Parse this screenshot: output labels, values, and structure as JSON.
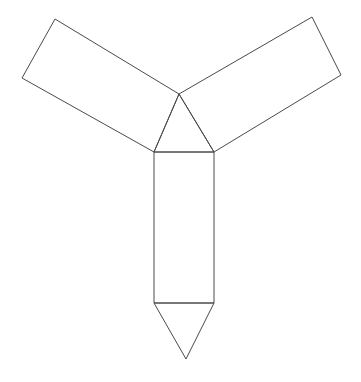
{
  "figure": {
    "name": "triangular-prism-net",
    "canvas": {
      "width": 361,
      "height": 382
    },
    "style": {
      "background_color": "#ffffff",
      "stroke_color": "#4a4a4a",
      "stroke_width": 1,
      "fill_color": "none"
    },
    "vertices": {
      "center_apex": [
        179,
        94
      ],
      "triangle_left": [
        154,
        152
      ],
      "triangle_right": [
        214,
        152
      ],
      "left_arm_outer_top": [
        55,
        19
      ],
      "left_arm_outer_bottom": [
        22,
        78
      ],
      "right_arm_outer_top": [
        312,
        17
      ],
      "right_arm_outer_bottom": [
        341,
        75
      ],
      "rect_bottom_left": [
        154,
        303
      ],
      "rect_bottom_right": [
        214,
        303
      ],
      "bottom_apex": [
        186,
        359
      ]
    },
    "faces": [
      {
        "name": "center-triangle",
        "shape": "triangle",
        "points": "179,94 154,152 214,152"
      },
      {
        "name": "left-rectangle-arm",
        "shape": "parallelogram",
        "points": "179,94 55,19 22,78 154,152"
      },
      {
        "name": "right-rectangle-arm",
        "shape": "parallelogram",
        "points": "179,94 312,17 341,75 214,152"
      },
      {
        "name": "bottom-rectangle-arm",
        "shape": "rectangle",
        "points": "154,152 214,152 214,303 154,303"
      },
      {
        "name": "bottom-triangle",
        "shape": "triangle",
        "points": "154,303 214,303 186,359"
      }
    ],
    "edges": [
      {
        "name": "center-triangle-left-edge",
        "from": "center_apex",
        "to": "triangle_left"
      },
      {
        "name": "center-triangle-right-edge",
        "from": "center_apex",
        "to": "triangle_right"
      },
      {
        "name": "center-triangle-base-edge",
        "from": "triangle_left",
        "to": "triangle_right"
      },
      {
        "name": "left-arm-top-edge",
        "from": "center_apex",
        "to": "left_arm_outer_top"
      },
      {
        "name": "left-arm-outer-edge",
        "from": "left_arm_outer_top",
        "to": "left_arm_outer_bottom"
      },
      {
        "name": "left-arm-bottom-edge",
        "from": "left_arm_outer_bottom",
        "to": "triangle_left"
      },
      {
        "name": "right-arm-top-edge",
        "from": "center_apex",
        "to": "right_arm_outer_top"
      },
      {
        "name": "right-arm-outer-edge",
        "from": "right_arm_outer_top",
        "to": "right_arm_outer_bottom"
      },
      {
        "name": "right-arm-bottom-edge",
        "from": "right_arm_outer_bottom",
        "to": "triangle_right"
      },
      {
        "name": "bottom-arm-left-edge",
        "from": "triangle_left",
        "to": "rect_bottom_left"
      },
      {
        "name": "bottom-arm-right-edge",
        "from": "triangle_right",
        "to": "rect_bottom_right"
      },
      {
        "name": "bottom-arm-fold-edge",
        "from": "rect_bottom_left",
        "to": "rect_bottom_right"
      },
      {
        "name": "bottom-triangle-left-edge",
        "from": "rect_bottom_left",
        "to": "bottom_apex"
      },
      {
        "name": "bottom-triangle-right-edge",
        "from": "rect_bottom_right",
        "to": "bottom_apex"
      }
    ]
  }
}
